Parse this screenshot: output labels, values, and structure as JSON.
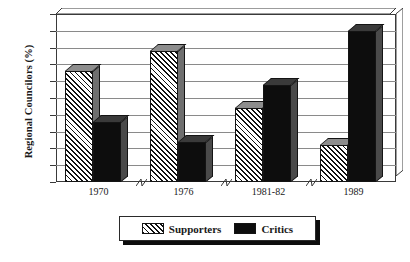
{
  "chart_data": {
    "type": "bar",
    "title": "",
    "subtitle": "",
    "xlabel": "",
    "ylabel": "Regional Councilors (%)",
    "categories": [
      "1970",
      "1976",
      "1981-82",
      "1989"
    ],
    "series": [
      {
        "name": "Supporters",
        "values": [
          33,
          39,
          22,
          11
        ],
        "pattern": "diagonal-hatch",
        "color": "#ffffff"
      },
      {
        "name": "Critics",
        "values": [
          18,
          12,
          29,
          45
        ],
        "pattern": "solid",
        "color": "#0d0d0d"
      }
    ],
    "ylim": [
      0,
      50
    ],
    "ytick_step": 5,
    "yticks": [
      "0",
      "5",
      "10",
      "15",
      "20",
      "25",
      "30",
      "35",
      "40",
      "45",
      "50"
    ],
    "grid": "horizontal",
    "legend_position": "bottom",
    "style": "3d-bar",
    "axis_breaks_between_groups": true
  },
  "legend": {
    "entries": [
      {
        "label": "Supporters",
        "swatch": "hatched-swatch"
      },
      {
        "label": "Critics",
        "swatch": "solid-black-swatch"
      }
    ]
  }
}
